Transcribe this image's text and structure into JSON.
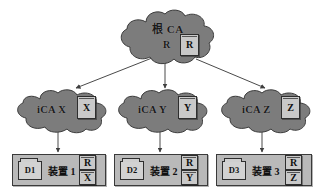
{
  "diagram": {
    "colors": {
      "cloud_fill": "#7c7c7c",
      "cloud_stroke": "#3c3c3c",
      "cert_fill": "#c9c9c9",
      "device_fill": "#b9b9b9",
      "edge": "#4a4a4a",
      "background": "#ffffff"
    }
  },
  "root": {
    "name": "根 CA",
    "subscript": "R",
    "cert": "R"
  },
  "intermediates": [
    {
      "name": "iCA X",
      "cert": "X"
    },
    {
      "name": "iCA Y",
      "cert": "Y"
    },
    {
      "name": "iCA Z",
      "cert": "Z"
    }
  ],
  "devices": [
    {
      "icon_label": "D1",
      "label": "装置 1",
      "certs": [
        "R",
        "X"
      ]
    },
    {
      "icon_label": "D2",
      "label": "装置 2",
      "certs": [
        "R",
        "Y"
      ]
    },
    {
      "icon_label": "D3",
      "label": "装置 3",
      "certs": [
        "R",
        "Z"
      ]
    }
  ],
  "edges": [
    {
      "from": "root",
      "to": "iCA X",
      "style": "arrow"
    },
    {
      "from": "root",
      "to": "iCA Y",
      "style": "arrow"
    },
    {
      "from": "root",
      "to": "iCA Z",
      "style": "arrow"
    },
    {
      "from": "iCA X",
      "to": "装置 1",
      "style": "arrow"
    },
    {
      "from": "iCA Y",
      "to": "装置 2",
      "style": "arrow"
    },
    {
      "from": "iCA Z",
      "to": "装置 3",
      "style": "arrow"
    }
  ]
}
